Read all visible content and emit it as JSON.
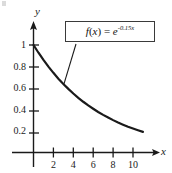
{
  "figure": {
    "title": "",
    "background_color": "#ffffff",
    "ink_color": "#1a1a1a"
  },
  "axes": {
    "x_name": "x",
    "y_name": "y"
  },
  "formula": {
    "f_part": "f",
    "arg_open": "(",
    "arg_var": "x",
    "arg_close": ")",
    "equals": " = ",
    "base": "e",
    "exponent": "-0.15x",
    "full_text": "f(x) = e^(-0.15x)"
  },
  "chart_data": {
    "type": "line",
    "title": "",
    "xlabel": "x",
    "ylabel": "y",
    "grid": false,
    "legend": null,
    "annotations": [
      {
        "text": "f(x) = e^{-0.15x}",
        "boxed": true,
        "leader_line": true,
        "points_to": {
          "x": 3.05,
          "y": 0.633
        }
      }
    ],
    "xlim": [
      0,
      11.6
    ],
    "ylim": [
      0,
      1.12
    ],
    "xticks": [
      2,
      4,
      6,
      8,
      10
    ],
    "xtick_labels": [
      "2",
      "4",
      "6",
      "8",
      "10"
    ],
    "yticks": [
      0.2,
      0.4,
      0.6,
      0.8,
      1
    ],
    "ytick_labels": [
      "0.2",
      "0.4",
      "0.6",
      "0.8",
      "1"
    ],
    "series": [
      {
        "name": "f(x) = e^(-0.15x)",
        "color": "#1a1a1a",
        "linewidth": 2.2,
        "x": [
          0,
          0.5,
          1,
          1.5,
          2,
          2.5,
          3,
          3.5,
          4,
          4.5,
          5,
          5.5,
          6,
          6.5,
          7,
          7.5,
          8,
          8.5,
          9,
          9.5,
          10,
          10.5,
          11
        ],
        "y": [
          1.0,
          0.928,
          0.861,
          0.799,
          0.741,
          0.687,
          0.638,
          0.592,
          0.549,
          0.509,
          0.472,
          0.438,
          0.407,
          0.377,
          0.35,
          0.325,
          0.301,
          0.279,
          0.259,
          0.24,
          0.223,
          0.207,
          0.192
        ]
      }
    ]
  }
}
